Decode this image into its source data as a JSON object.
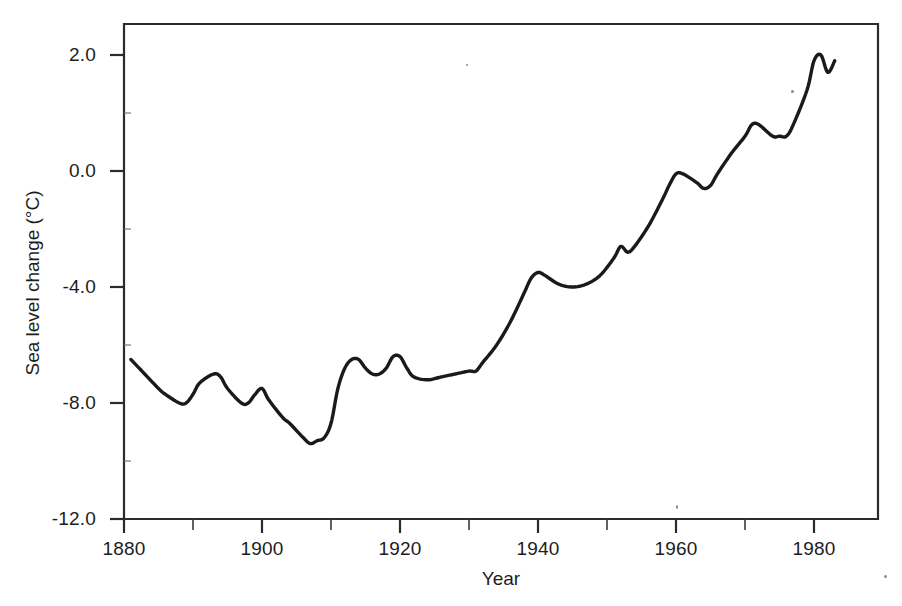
{
  "chart_data": {
    "type": "line",
    "title": "",
    "xlabel": "Year",
    "ylabel": "Sea level change (°C)",
    "xlim": [
      1880,
      1989
    ],
    "ylim": [
      -12.0,
      3.0
    ],
    "grid": false,
    "legend": false,
    "legend_position": "none",
    "line_color": "#1a1a1a",
    "x_tick_labels": [
      "1880",
      "1900",
      "1920",
      "1940",
      "1960",
      "1980"
    ],
    "x_tick_values": [
      1880,
      1900,
      1920,
      1940,
      1960,
      1980
    ],
    "x_minor_tick_values": [
      1890,
      1910,
      1930,
      1950,
      1970
    ],
    "y_tick_labels": [
      "2.0",
      "0.0",
      "-4.0",
      "-8.0",
      "-12.0"
    ],
    "y_tick_values": [
      2.0,
      0.0,
      -4.0,
      -8.0,
      -12.0
    ],
    "series": [
      {
        "name": "Sea level change",
        "x": [
          1881,
          1883,
          1885,
          1886,
          1888,
          1889,
          1890,
          1891,
          1893,
          1894,
          1895,
          1897,
          1898,
          1899,
          1900,
          1901,
          1903,
          1904,
          1906,
          1907,
          1908,
          1909,
          1910,
          1911,
          1912,
          1913,
          1914,
          1915,
          1916,
          1917,
          1918,
          1919,
          1920,
          1921,
          1922,
          1924,
          1926,
          1928,
          1930,
          1931,
          1932,
          1934,
          1936,
          1938,
          1939,
          1940,
          1941,
          1943,
          1945,
          1947,
          1949,
          1951,
          1952,
          1953,
          1954,
          1956,
          1958,
          1959,
          1960,
          1961,
          1963,
          1964,
          1965,
          1966,
          1968,
          1970,
          1971,
          1972,
          1974,
          1975,
          1976,
          1977,
          1979,
          1980,
          1981,
          1982,
          1983
        ],
        "values": [
          -6.5,
          -7.0,
          -7.5,
          -7.7,
          -8.0,
          -8.0,
          -7.7,
          -7.3,
          -7.0,
          -7.1,
          -7.5,
          -8.0,
          -8.0,
          -7.7,
          -7.5,
          -7.9,
          -8.5,
          -8.7,
          -9.2,
          -9.4,
          -9.3,
          -9.2,
          -8.7,
          -7.5,
          -6.8,
          -6.5,
          -6.5,
          -6.8,
          -7.0,
          -7.0,
          -6.8,
          -6.4,
          -6.4,
          -6.8,
          -7.1,
          -7.2,
          -7.1,
          -7.0,
          -6.9,
          -6.9,
          -6.6,
          -6.0,
          -5.2,
          -4.2,
          -3.7,
          -3.5,
          -3.6,
          -3.9,
          -4.0,
          -3.9,
          -3.6,
          -3.0,
          -2.6,
          -2.8,
          -2.6,
          -1.9,
          -1.0,
          -0.5,
          -0.1,
          -0.1,
          -0.4,
          -0.6,
          -0.5,
          -0.1,
          0.3,
          0.6,
          0.8,
          0.8,
          0.6,
          0.6,
          0.6,
          0.8,
          1.4,
          1.9,
          2.0,
          1.7,
          1.9
        ],
        "y_units": "°C"
      }
    ]
  },
  "axes": {
    "y_title": "Sea level change (°C)",
    "x_title": "Year",
    "y_labels": [
      {
        "text": "2.0",
        "value": 2.0
      },
      {
        "text": "0.0",
        "value": 0.0
      },
      {
        "text": "-4.0",
        "value": -4.0
      },
      {
        "text": "-8.0",
        "value": -8.0
      },
      {
        "text": "-12.0",
        "value": -12.0
      }
    ],
    "x_labels": [
      {
        "text": "1880",
        "value": 1880
      },
      {
        "text": "1900",
        "value": 1900
      },
      {
        "text": "1920",
        "value": 1920
      },
      {
        "text": "1940",
        "value": 1940
      },
      {
        "text": "1960",
        "value": 1960
      },
      {
        "text": "1980",
        "value": 1980
      }
    ]
  }
}
